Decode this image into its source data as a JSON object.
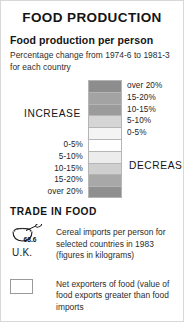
{
  "panel": {
    "title": "FOOD PRODUCTION"
  },
  "production": {
    "heading": "Food production per person",
    "note": "Percentage change from 1974-6 to 1981-3 for each country",
    "increase_label": "INCREASE",
    "decrease_label": "DECREASE",
    "increase_steps": [
      {
        "label": "over  20%",
        "color": "#8d8d8d"
      },
      {
        "label": "15-20%",
        "color": "#a3a3a3"
      },
      {
        "label": "10-15%",
        "color": "#9b9b9b"
      },
      {
        "label": "5-10%",
        "color": "#d5d5d5"
      },
      {
        "label": "0-5%",
        "color": "#f4f4f4"
      }
    ],
    "decrease_steps": [
      {
        "label": "0-5%",
        "color": "#ffffff"
      },
      {
        "label": "5-10%",
        "color": "#ececec"
      },
      {
        "label": "10-15%",
        "color": "#cfcfcf"
      },
      {
        "label": "15-20%",
        "color": "#a8a8a8"
      },
      {
        "label": "over 20%",
        "color": "#8f8f8f"
      }
    ]
  },
  "trade": {
    "heading": "TRADE IN FOOD",
    "cereal_icon_value": "68.6",
    "cereal_icon_country": "U.K.",
    "cereal_text": "Cereal imports per person for selected countries in 1983 (figures in kilograms)",
    "exporter_text": "Net exporters of food (value of food exports greater than food imports"
  }
}
